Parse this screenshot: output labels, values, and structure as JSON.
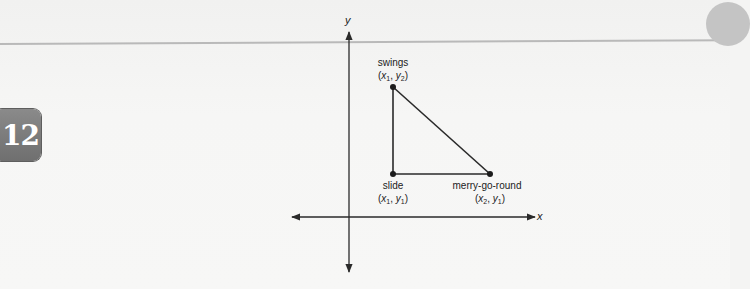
{
  "page": {
    "chapter_number": "12",
    "colors": {
      "background": "#f4f4f3",
      "rule": "#b9b9b9",
      "badge": "#7a7a7a",
      "lines": "#2a2a2a"
    }
  },
  "diagram": {
    "type": "coordinate-plane-right-triangle",
    "axes": {
      "x_label": "x",
      "y_label": "y",
      "origin_px": [
        349,
        217
      ]
    },
    "points": [
      {
        "name": "swings",
        "coord_var_x": "x",
        "coord_sub_x": "1",
        "coord_var_y": "y",
        "coord_sub_y": "2",
        "px": [
          393,
          87
        ]
      },
      {
        "name": "slide",
        "coord_var_x": "x",
        "coord_sub_x": "1",
        "coord_var_y": "y",
        "coord_sub_y": "1",
        "px": [
          393,
          174
        ]
      },
      {
        "name": "merry-go-round",
        "coord_var_x": "x",
        "coord_sub_x": "2",
        "coord_var_y": "y",
        "coord_sub_y": "1",
        "px": [
          490,
          174
        ]
      }
    ],
    "segments": [
      [
        "swings",
        "slide"
      ],
      [
        "slide",
        "merry-go-round"
      ],
      [
        "swings",
        "merry-go-round"
      ]
    ]
  }
}
